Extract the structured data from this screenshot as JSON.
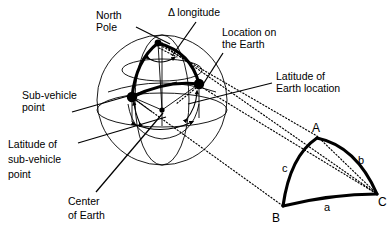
{
  "figure": {
    "background_color": "#ffffff",
    "line_color": "#000000"
  },
  "labels": {
    "north_pole": {
      "line1": "North",
      "line2": "Pole"
    },
    "delta_longitude": {
      "line1": "Δ longitude"
    },
    "location_on_earth": {
      "line1": "Location on",
      "line2": "the Earth"
    },
    "latitude_of_earth_location": {
      "line1": "Latitude of",
      "line2": "Earth location"
    },
    "sub_vehicle_point": {
      "line1": "Sub-vehicle",
      "line2": "point"
    },
    "latitude_of_sub_vehicle_point": {
      "line1": "Latitude of",
      "line2": "sub-vehicle",
      "line3": "point"
    },
    "center_of_earth": {
      "line1": "Center",
      "line2": "of Earth"
    }
  },
  "spherical_triangle": {
    "vertices": [
      {
        "name": "A",
        "label": "A"
      },
      {
        "name": "B",
        "label": "B"
      },
      {
        "name": "C",
        "label": "C"
      }
    ],
    "sides": [
      {
        "name": "a",
        "label": "a"
      },
      {
        "name": "b",
        "label": "b"
      },
      {
        "name": "c",
        "label": "c"
      }
    ]
  },
  "sphere": {
    "name": "earth-sphere",
    "center_point_name": "center-of-earth-point",
    "marked_points": [
      {
        "name": "north-pole-vertex"
      },
      {
        "name": "sub-vehicle-point-marker"
      },
      {
        "name": "earth-location-point-marker"
      },
      {
        "name": "center-of-earth-point"
      }
    ]
  }
}
